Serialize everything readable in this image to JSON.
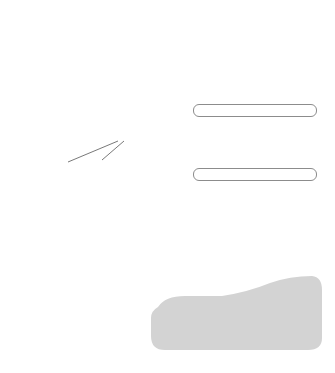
{
  "diagram": {
    "callout": {
      "line1": "complementary",
      "line2": "base pairs"
    },
    "legend": [
      {
        "id": "at",
        "left_label": "adenine",
        "right_label": "thymine",
        "left_color": "#f7f7f7",
        "right_color": "#9a9a9a"
      },
      {
        "id": "gc",
        "left_label": "guanine",
        "right_label": "cytosine",
        "left_color": "#7c7c7c",
        "right_color": "#dcdcdc"
      }
    ],
    "colors": {
      "strand_light": "#eeeeee",
      "strand_mid": "#bdbdbd",
      "strand_dark": "#6e6e6e",
      "outline": "#555555",
      "caption_bg": "#d3d3d3",
      "text": "#555555"
    },
    "base_pairs": [
      {
        "pair": "A-T"
      },
      {
        "pair": "G-C"
      },
      {
        "pair": "A-T"
      },
      {
        "pair": "G-C"
      },
      {
        "pair": "A-T"
      },
      {
        "pair": "G-C"
      },
      {
        "pair": "A-T"
      },
      {
        "pair": "G-C"
      },
      {
        "pair": "A-T"
      },
      {
        "pair": "G-C"
      },
      {
        "pair": "A-T"
      },
      {
        "pair": "G-C"
      },
      {
        "pair": "A-T"
      },
      {
        "pair": "G-C"
      },
      {
        "pair": "A-T"
      },
      {
        "pair": "G-C"
      }
    ]
  }
}
